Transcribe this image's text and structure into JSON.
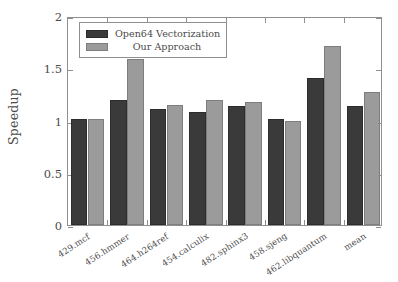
{
  "chart_data": {
    "type": "bar",
    "title": "",
    "xlabel": "",
    "ylabel": "Speedup",
    "ylim": [
      0,
      2
    ],
    "yticks": [
      0,
      0.5,
      1,
      1.5,
      2
    ],
    "ytick_labels": [
      "0",
      "0.5",
      "1",
      "1.5",
      "2"
    ],
    "grid": false,
    "legend_position": "upper left",
    "categories": [
      "429.mcf",
      "456.hmmer",
      "464.h264ref",
      "454.calculix",
      "482.sphinx3",
      "458.sjeng",
      "462.libquantum",
      "mean"
    ],
    "series": [
      {
        "name": "Open64 Vectorization",
        "color": "#3a3a3a",
        "values": [
          1.01,
          1.2,
          1.11,
          1.08,
          1.14,
          1.01,
          1.41,
          1.14
        ]
      },
      {
        "name": "Our Approach",
        "color": "#9b9b9b",
        "values": [
          1.01,
          1.59,
          1.15,
          1.2,
          1.18,
          1.0,
          1.71,
          1.27
        ]
      }
    ]
  },
  "legend": {
    "entries": [
      {
        "label": "Open64 Vectorization",
        "swatch": "series0"
      },
      {
        "label": "Our Approach",
        "swatch": "series1"
      }
    ]
  }
}
